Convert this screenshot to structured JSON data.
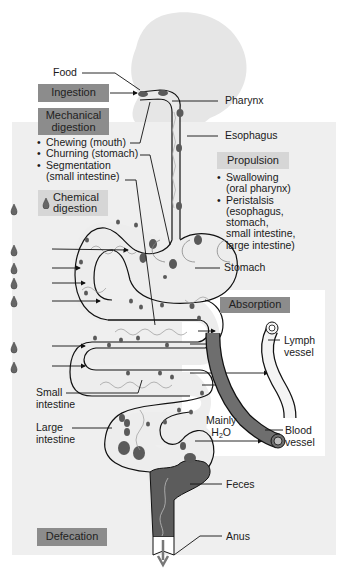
{
  "diagram": {
    "colors": {
      "panel_gray": "#efefef",
      "panel_white": "#ffffff",
      "box_dark": "#8c8c8c",
      "box_light": "#d6d6d6",
      "tract_fill": "#ececec",
      "food_particle": "#5a5a5a",
      "blood_vessel": "#6e6e6e",
      "feces": "#5c5c5c",
      "silhouette": "#e6e6e6"
    },
    "process_boxes": {
      "ingestion": "Ingestion",
      "mechanical_digestion_line1": "Mechanical",
      "mechanical_digestion_line2": "digestion",
      "chemical_digestion_line1": "Chemical",
      "chemical_digestion_line2": "digestion",
      "propulsion": "Propulsion",
      "absorption": "Absorption",
      "defecation": "Defecation"
    },
    "mechanical_list": [
      {
        "line1": "Chewing (mouth)"
      },
      {
        "line1": "Churning (stomach)"
      },
      {
        "line1": "Segmentation",
        "line2": "(small intestine)"
      }
    ],
    "propulsion_list": [
      {
        "line1": "Swallowing",
        "line2": "(oral pharynx)"
      },
      {
        "line1": "Peristalsis",
        "line2": "(esophagus,",
        "line3": "stomach,",
        "line4": "small intestine,",
        "line5": "large intestine)"
      }
    ],
    "anatomy_labels": {
      "food": "Food",
      "pharynx": "Pharynx",
      "esophagus": "Esophagus",
      "stomach": "Stomach",
      "lymph_vessel_line1": "Lymph",
      "lymph_vessel_line2": "vessel",
      "small_intestine_line1": "Small",
      "small_intestine_line2": "intestine",
      "large_intestine_line1": "Large",
      "large_intestine_line2": "intestine",
      "mainly": "Mainly",
      "h2o_h": "H",
      "h2o_sub": "2",
      "h2o_o": "O",
      "blood_vessel_line1": "Blood",
      "blood_vessel_line2": "vessel",
      "feces": "Feces",
      "anus": "Anus"
    },
    "icons": {
      "enzyme_drop": "enzyme-drop-icon",
      "count_enzyme_drops_left": 6
    }
  }
}
